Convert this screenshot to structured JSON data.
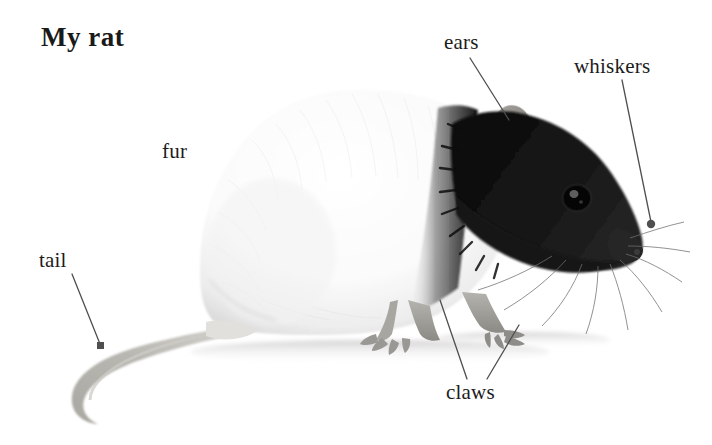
{
  "page": {
    "title": "My rat",
    "background_color": "#ffffff",
    "width": 712,
    "height": 445
  },
  "photo": {
    "subject": "rat",
    "description": "Side view photograph of a hooded rat facing right, white body with black head and shoulders, long pale tail curving to the lower left",
    "alt_text": "rat-photograph",
    "colors": {
      "body_white": "#f7f7f7",
      "body_shadow": "#d8d8d8",
      "head_black": "#111111",
      "ear_gray": "#8d8a87",
      "tail_gray": "#b9b7b2",
      "leader_line": "#5a5a5a"
    }
  },
  "labels": {
    "fur": "fur",
    "ears": "ears",
    "whiskers": "whiskers",
    "tail": "tail",
    "claws": "claws"
  },
  "annotations": {
    "ears_leader": "leader-line-ears",
    "whiskers_leader": "leader-line-whiskers",
    "tail_leader": "leader-line-tail",
    "claws_leader_left": "leader-line-claws-left",
    "claws_leader_right": "leader-line-claws-right"
  }
}
